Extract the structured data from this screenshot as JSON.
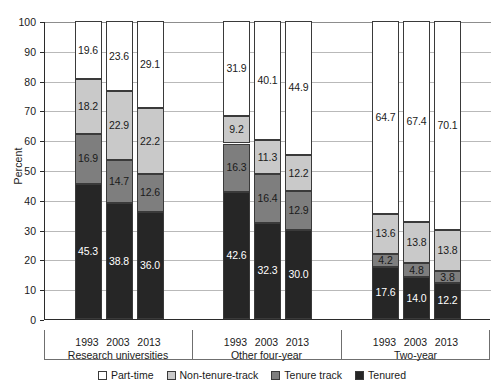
{
  "chart_data": {
    "type": "bar",
    "subtype": "stacked-bar-100",
    "title": "",
    "xlabel": "",
    "ylabel": "Percent",
    "ylim": [
      0,
      100
    ],
    "ytick_step": 10,
    "yticks": [
      "0",
      "10",
      "20",
      "30",
      "40",
      "50",
      "60",
      "70",
      "80",
      "90",
      "100"
    ],
    "grid": true,
    "legend_position": "bottom",
    "stack_order_bottom_to_top": [
      "Tenured",
      "Tenure track",
      "Non-tenure-track",
      "Part-time"
    ],
    "series": [
      {
        "name": "Tenured",
        "color": "#262626",
        "values": [
          45.3,
          38.8,
          36.0,
          42.6,
          32.3,
          30.0,
          17.6,
          14.0,
          12.2
        ]
      },
      {
        "name": "Tenure track",
        "color": "#7e7e7e",
        "values": [
          16.9,
          14.7,
          12.6,
          16.3,
          16.4,
          12.9,
          4.2,
          4.8,
          3.8
        ]
      },
      {
        "name": "Non-tenure-track",
        "color": "#c9c9c9",
        "values": [
          18.2,
          22.9,
          22.2,
          9.2,
          11.3,
          12.2,
          13.6,
          13.8,
          13.8
        ]
      },
      {
        "name": "Part-time",
        "color": "#ffffff",
        "values": [
          19.6,
          23.6,
          29.1,
          31.9,
          40.1,
          44.9,
          64.7,
          67.4,
          70.1
        ]
      }
    ],
    "categories": [
      "1993",
      "2003",
      "2013",
      "1993",
      "2003",
      "2013",
      "1993",
      "2003",
      "2013"
    ],
    "groups": [
      {
        "label": "Research universities",
        "years": [
          "1993",
          "2003",
          "2013"
        ]
      },
      {
        "label": "Other four-year",
        "years": [
          "1993",
          "2003",
          "2013"
        ]
      },
      {
        "label": "Two-year",
        "years": [
          "1993",
          "2003",
          "2013"
        ]
      }
    ],
    "bars": [
      {
        "group": "Research universities",
        "year": "1993",
        "tenured": "45.3",
        "tenure_track": "16.9",
        "non_tenure_track": "18.2",
        "part_time": "19.6"
      },
      {
        "group": "Research universities",
        "year": "2003",
        "tenured": "38.8",
        "tenure_track": "14.7",
        "non_tenure_track": "22.9",
        "part_time": "23.6"
      },
      {
        "group": "Research universities",
        "year": "2013",
        "tenured": "36.0",
        "tenure_track": "12.6",
        "non_tenure_track": "22.2",
        "part_time": "29.1"
      },
      {
        "group": "Other four-year",
        "year": "1993",
        "tenured": "42.6",
        "tenure_track": "16.3",
        "non_tenure_track": "9.2",
        "part_time": "31.9"
      },
      {
        "group": "Other four-year",
        "year": "2003",
        "tenured": "32.3",
        "tenure_track": "16.4",
        "non_tenure_track": "11.3",
        "part_time": "40.1"
      },
      {
        "group": "Other four-year",
        "year": "2013",
        "tenured": "30.0",
        "tenure_track": "12.9",
        "non_tenure_track": "12.2",
        "part_time": "44.9"
      },
      {
        "group": "Two-year",
        "year": "1993",
        "tenured": "17.6",
        "tenure_track": "4.2",
        "non_tenure_track": "13.6",
        "part_time": "64.7"
      },
      {
        "group": "Two-year",
        "year": "2003",
        "tenured": "14.0",
        "tenure_track": "4.8",
        "non_tenure_track": "13.8",
        "part_time": "67.4"
      },
      {
        "group": "Two-year",
        "year": "2013",
        "tenured": "12.2",
        "tenure_track": "3.8",
        "non_tenure_track": "13.8",
        "part_time": "70.1"
      }
    ],
    "legend": [
      {
        "label": "Part-time",
        "color": "#ffffff"
      },
      {
        "label": "Non-tenure-track",
        "color": "#c9c9c9"
      },
      {
        "label": "Tenure track",
        "color": "#7e7e7e"
      },
      {
        "label": "Tenured",
        "color": "#262626"
      }
    ]
  }
}
